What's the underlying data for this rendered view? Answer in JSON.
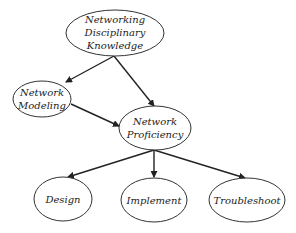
{
  "diagram": {
    "type": "hierarchy",
    "nodes": [
      {
        "id": "ndk",
        "lines": [
          "Networking",
          "Disciplinary",
          "Knowledge"
        ]
      },
      {
        "id": "nm",
        "lines": [
          "Network",
          "Modeling"
        ]
      },
      {
        "id": "np",
        "lines": [
          "Network",
          "Proficiency"
        ]
      },
      {
        "id": "design",
        "lines": [
          "Design"
        ]
      },
      {
        "id": "implement",
        "lines": [
          "Implement"
        ]
      },
      {
        "id": "troubleshoot",
        "lines": [
          "Troubleshoot"
        ]
      }
    ],
    "edges": [
      {
        "from": "Networking Disciplinary Knowledge",
        "to": "Network Modeling"
      },
      {
        "from": "Networking Disciplinary Knowledge",
        "to": "Network Proficiency"
      },
      {
        "from": "Network Modeling",
        "to": "Network Proficiency"
      },
      {
        "from": "Network Proficiency",
        "to": "Design"
      },
      {
        "from": "Network Proficiency",
        "to": "Implement"
      },
      {
        "from": "Network Proficiency",
        "to": "Troubleshoot"
      }
    ],
    "colors": {
      "stroke": "#333333",
      "text": "#222222",
      "background": "#ffffff"
    }
  }
}
